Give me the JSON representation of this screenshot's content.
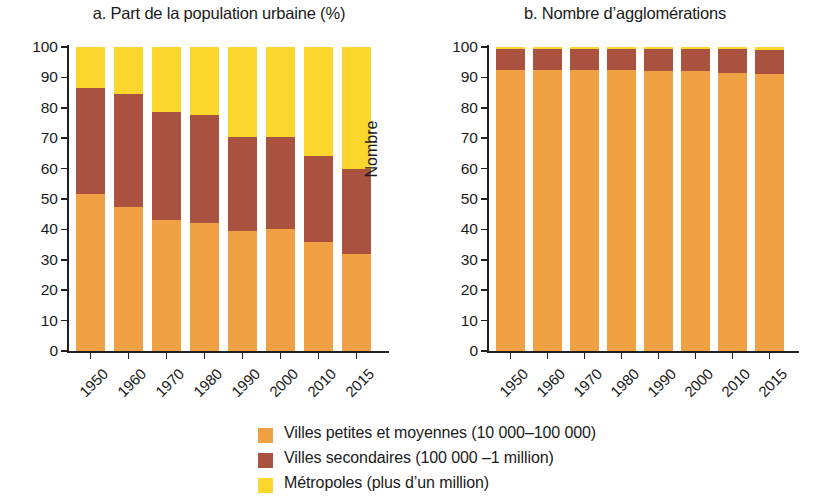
{
  "chart_data": [
    {
      "type": "bar",
      "id": "panel-a",
      "title": "a. Part de la population urbaine (%)",
      "xlabel": "",
      "ylabel": "Part (%)",
      "ylim": [
        0,
        100
      ],
      "yticks": [
        0,
        10,
        20,
        30,
        40,
        50,
        60,
        70,
        80,
        90,
        100
      ],
      "categories": [
        "1950",
        "1960",
        "1970",
        "1980",
        "1990",
        "2000",
        "2010",
        "2015"
      ],
      "stacked": true,
      "grid": false,
      "series": [
        {
          "name": "Villes petites et moyennes (10 000–100 000)",
          "color": "#f0a143",
          "values": [
            51.5,
            47.5,
            43,
            42,
            39.5,
            40,
            36,
            32
          ]
        },
        {
          "name": "Villes secondaires (100 000 –1 million)",
          "color": "#a9523f",
          "values": [
            35,
            37,
            35.5,
            35.5,
            31,
            30.5,
            28,
            28
          ]
        },
        {
          "name": "Métropoles (plus d’un million)",
          "color": "#fbd72e",
          "values": [
            13.5,
            15.5,
            21.5,
            22.5,
            29.5,
            29.5,
            36,
            40
          ]
        }
      ],
      "cumulative_tops": {
        "small": [
          51.5,
          47.5,
          43,
          42,
          39.5,
          40,
          36,
          32
        ],
        "secondary": [
          86.5,
          84.5,
          78.5,
          77.5,
          70.5,
          70.5,
          64,
          60
        ],
        "metro": [
          100,
          100,
          100,
          100,
          100,
          100,
          100,
          100
        ]
      }
    },
    {
      "type": "bar",
      "id": "panel-b",
      "title": "b. Nombre d’agglomérations",
      "xlabel": "",
      "ylabel": "Nombre",
      "ylim": [
        0,
        100
      ],
      "yticks": [
        0,
        10,
        20,
        30,
        40,
        50,
        60,
        70,
        80,
        90,
        100
      ],
      "categories": [
        "1950",
        "1960",
        "1970",
        "1980",
        "1990",
        "2000",
        "2010",
        "2015"
      ],
      "stacked": true,
      "grid": false,
      "series": [
        {
          "name": "Villes petites et moyennes (10 000–100 000)",
          "color": "#f0a143",
          "values": [
            92.5,
            92.5,
            92.5,
            92.5,
            92,
            92,
            91.5,
            91
          ]
        },
        {
          "name": "Villes secondaires (100 000 –1 million)",
          "color": "#a9523f",
          "values": [
            7,
            7,
            7,
            7,
            7.3,
            7.3,
            7.7,
            8
          ]
        },
        {
          "name": "Métropoles (plus d’un million)",
          "color": "#fbd72e",
          "values": [
            0.5,
            0.5,
            0.5,
            0.5,
            0.7,
            0.7,
            0.8,
            1
          ]
        }
      ],
      "cumulative_tops": {
        "small": [
          92.5,
          92.5,
          92.5,
          92.5,
          92,
          92,
          91.5,
          91
        ],
        "secondary": [
          99.5,
          99.5,
          99.5,
          99.5,
          99.3,
          99.3,
          99.2,
          99
        ],
        "metro": [
          100,
          100,
          100,
          100,
          100,
          100,
          100,
          100
        ]
      }
    }
  ],
  "legend": {
    "items": [
      {
        "label": "Villes petites et moyennes (10 000–100 000)",
        "color": "#f0a143"
      },
      {
        "label": "Villes secondaires (100 000 –1 million)",
        "color": "#a9523f"
      },
      {
        "label": "Métropoles (plus d’un million)",
        "color": "#fbd72e"
      }
    ]
  }
}
